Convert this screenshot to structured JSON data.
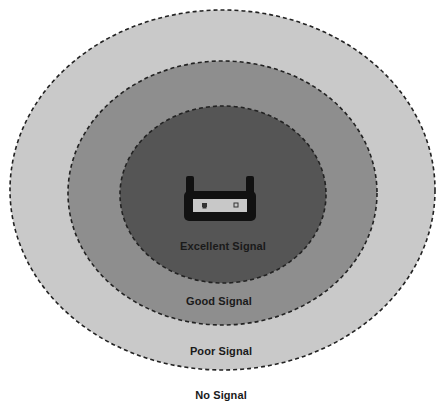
{
  "diagram": {
    "type": "wifi-coverage-zones",
    "center_device": {
      "icon": "wireless-router-icon"
    },
    "zones": [
      {
        "id": "no-signal",
        "label": "No Signal",
        "color": "#ffffff"
      },
      {
        "id": "poor-signal",
        "label": "Poor Signal",
        "color": "#c9c9c9"
      },
      {
        "id": "good-signal",
        "label": "Good Signal",
        "color": "#8e8e8e"
      },
      {
        "id": "excellent-signal",
        "label": "Excellent Signal",
        "color": "#555555"
      }
    ],
    "border_style": "dashed",
    "border_color": "#222222"
  }
}
